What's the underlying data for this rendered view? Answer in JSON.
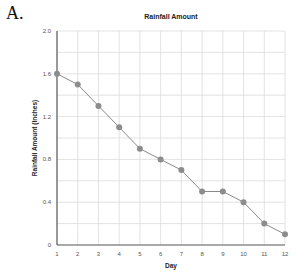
{
  "panel_label": "A.",
  "chart_data": {
    "type": "line",
    "title": "Rainfall Amount",
    "xlabel": "Day",
    "ylabel": "Rainfall Amount (Inches)",
    "x": [
      1,
      2,
      3,
      4,
      5,
      6,
      7,
      8,
      9,
      10,
      11,
      12
    ],
    "categories": [
      "1",
      "2",
      "3",
      "4",
      "5",
      "6",
      "7",
      "8",
      "9",
      "10",
      "11",
      "12"
    ],
    "series": [
      {
        "name": "Rainfall Amount",
        "values": [
          1.6,
          1.5,
          1.3,
          1.1,
          0.9,
          0.8,
          0.7,
          0.5,
          0.5,
          0.4,
          0.2,
          0.1
        ]
      }
    ],
    "xlim": [
      1,
      12
    ],
    "ylim": [
      0,
      2.0
    ],
    "yticks": [
      0,
      0.4,
      0.8,
      1.2,
      1.6,
      2.0
    ],
    "ytick_labels": [
      "0",
      "0.4",
      "0.8",
      "1.2",
      "1.6",
      "2.0"
    ],
    "ygrid_step": 0.2,
    "grid": true,
    "legend": "none",
    "colors": {
      "line": "#8a8a8a",
      "marker": "#8c8c8c",
      "grid": "#dcdcdc",
      "axis": "#555555"
    }
  }
}
